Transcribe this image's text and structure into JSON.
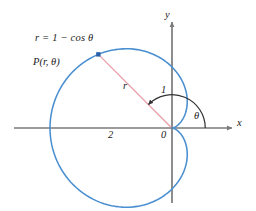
{
  "figure": {
    "kind": "polar-cardioid-diagram",
    "background_color": "#ffffff"
  },
  "colors": {
    "curve": "#4a8fd0",
    "axis": "#7a7a7a",
    "radius_line": "#e8a0a8",
    "angle_arc": "#333333",
    "point_marker": "#2a5faa",
    "text": "#1a1a1a"
  },
  "labels": {
    "equation": "r = 1 − cos θ",
    "point": "P(r, θ)",
    "radius": "r",
    "theta": "θ",
    "one": "1",
    "two": "2",
    "origin": "0",
    "x_axis": "x",
    "y_axis": "y"
  },
  "chart_data": {
    "type": "line",
    "plot_kind": "polar",
    "title": "",
    "subtitle": "",
    "xlabel": "x",
    "ylabel": "y",
    "equation": "r = 1 - cos(theta)",
    "curve_name": "cardioid",
    "grid": false,
    "legend": false,
    "legend_position": "none",
    "axes": {
      "origin_label": "0",
      "x_axis_arrow": true,
      "y_axis_arrow": true,
      "x_tick_labels": [
        "2",
        "0"
      ],
      "x_tick_values": [
        -2,
        0
      ],
      "y_tick_labels": [
        "1"
      ],
      "y_tick_values": [
        1
      ],
      "xlim": [
        -2.45,
        1.05
      ],
      "ylim": [
        -1.6,
        1.6
      ]
    },
    "annotations": [
      {
        "text": "r = 1 − cos θ",
        "role": "equation",
        "x": -1.75,
        "y": 1.35
      },
      {
        "text": "P(r, θ)",
        "role": "point-label",
        "x": -1.85,
        "y": 0.92
      },
      {
        "text": "r",
        "role": "radius-label",
        "x": -0.62,
        "y": 0.62
      },
      {
        "text": "θ",
        "role": "angle-label",
        "x": 0.3,
        "y": 0.22
      },
      {
        "text": "1",
        "role": "y-tick",
        "x": -0.15,
        "y": 0.6
      },
      {
        "text": "2",
        "role": "x-tick",
        "x": -0.9,
        "y": -0.12
      },
      {
        "text": "0",
        "role": "origin",
        "x": -0.14,
        "y": -0.12
      }
    ],
    "point_P": {
      "theta_degrees": 135,
      "r": 1.7071,
      "x": -1.2071,
      "y": 1.2071,
      "marker": "square",
      "marker_color": "#2a5faa"
    },
    "radius_segment": {
      "from": [
        0,
        0
      ],
      "to": [
        -1.2071,
        1.2071
      ],
      "label": "r",
      "color": "#e8a0a8"
    },
    "angle_arc": {
      "from_degrees": 0,
      "to_degrees": 135,
      "radius": 0.88,
      "arrow_at_end": true,
      "label": "θ",
      "color": "#333333"
    },
    "curve_extents": {
      "leftmost_x": -2.0,
      "rightmost_x": 0.0,
      "top_y": 1.299,
      "bottom_y": -1.299,
      "cusp": [
        0,
        0
      ]
    },
    "samples_theta_degrees": [
      0,
      15,
      30,
      45,
      60,
      75,
      90,
      105,
      120,
      135,
      150,
      165,
      180,
      195,
      210,
      225,
      240,
      255,
      270,
      285,
      300,
      315,
      330,
      345,
      360
    ],
    "samples_r": [
      0.0,
      0.0341,
      0.134,
      0.2929,
      0.5,
      0.7412,
      1.0,
      1.2588,
      1.5,
      1.7071,
      1.866,
      1.9659,
      2.0,
      1.9659,
      1.866,
      1.7071,
      1.5,
      1.2588,
      1.0,
      0.7412,
      0.5,
      0.2929,
      0.134,
      0.0341,
      0.0
    ]
  }
}
